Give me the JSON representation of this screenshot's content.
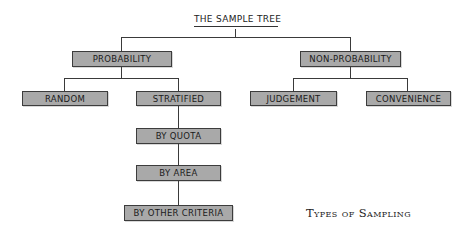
{
  "diagram": {
    "title": "THE SAMPLE TREE",
    "caption": "Types of Sampling",
    "nodes": {
      "probability": "PROBABILITY",
      "non_probability": "NON-PROBABILITY",
      "random": "RANDOM",
      "stratified": "STRATIFIED",
      "judgement": "JUDGEMENT",
      "convenience": "CONVENIENCE",
      "by_quota": "BY QUOTA",
      "by_area": "BY AREA",
      "by_other_criteria": "BY OTHER CRITERIA"
    },
    "edges": [
      [
        "THE SAMPLE TREE",
        "PROBABILITY"
      ],
      [
        "THE SAMPLE TREE",
        "NON-PROBABILITY"
      ],
      [
        "PROBABILITY",
        "RANDOM"
      ],
      [
        "PROBABILITY",
        "STRATIFIED"
      ],
      [
        "NON-PROBABILITY",
        "JUDGEMENT"
      ],
      [
        "NON-PROBABILITY",
        "CONVENIENCE"
      ],
      [
        "STRATIFIED",
        "BY QUOTA"
      ],
      [
        "BY QUOTA",
        "BY AREA"
      ],
      [
        "BY AREA",
        "BY OTHER CRITERIA"
      ]
    ],
    "colors": {
      "box_fill": "#a9a9a9",
      "box_border": "#3c3c3c",
      "line": "#3a3a3a",
      "background": "#ffffff"
    }
  }
}
